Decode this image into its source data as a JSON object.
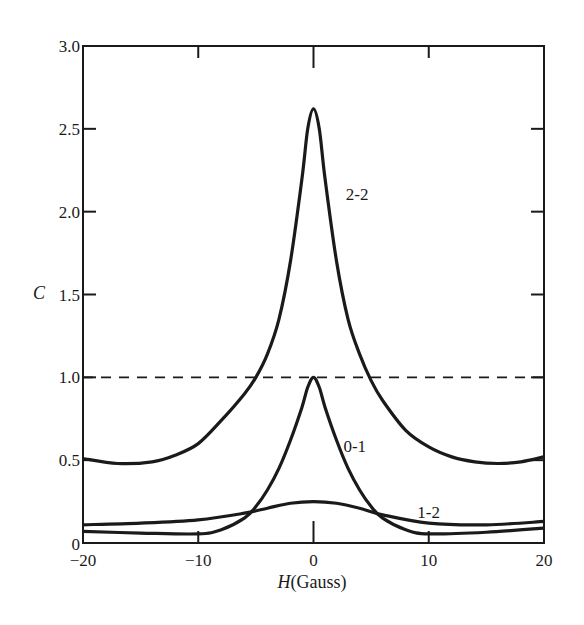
{
  "chart_data": {
    "type": "line",
    "title": "",
    "xlabel": "H(Gauss)",
    "xlabel_italic_part": "H",
    "xlabel_rest": "(Gauss)",
    "ylabel": "C",
    "xlim": [
      -20,
      20
    ],
    "ylim": [
      0,
      3.0
    ],
    "xticks": [
      -20,
      -10,
      0,
      10,
      20
    ],
    "xtick_labels": [
      "−20",
      "−10",
      "0",
      "10",
      "20"
    ],
    "yticks": [
      0,
      0.5,
      1.0,
      1.5,
      2.0,
      2.5,
      3.0
    ],
    "ytick_labels": [
      "0",
      "0.5",
      "1.0",
      "1.5",
      "2.0",
      "2.5",
      "3.0"
    ],
    "grid": false,
    "legend": "none (curves labeled inline)",
    "reference_line": {
      "y": 1.0,
      "style": "dashed"
    },
    "series": [
      {
        "name": "2-2",
        "label_pos": {
          "x": 2.8,
          "y": 2.07
        },
        "x": [
          -20,
          -17,
          -14,
          -12,
          -10,
          -8,
          -6,
          -5,
          -4,
          -3,
          -2,
          -1,
          -0.5,
          0,
          0.5,
          1,
          2,
          3,
          4,
          5,
          6,
          8,
          10,
          12,
          14,
          16,
          18,
          20
        ],
        "y": [
          0.51,
          0.48,
          0.49,
          0.53,
          0.6,
          0.74,
          0.9,
          1.0,
          1.14,
          1.35,
          1.7,
          2.2,
          2.5,
          2.62,
          2.5,
          2.2,
          1.7,
          1.35,
          1.14,
          0.98,
          0.86,
          0.68,
          0.58,
          0.52,
          0.49,
          0.48,
          0.49,
          0.52
        ]
      },
      {
        "name": "0-1",
        "label_pos": {
          "x": 2.6,
          "y": 0.55
        },
        "x": [
          -20,
          -15,
          -10,
          -8,
          -6,
          -5,
          -4,
          -3,
          -2,
          -1,
          -0.5,
          0,
          0.5,
          1,
          2,
          3,
          4,
          5,
          6,
          8,
          10,
          15,
          20
        ],
        "y": [
          0.07,
          0.06,
          0.055,
          0.08,
          0.15,
          0.22,
          0.32,
          0.45,
          0.62,
          0.82,
          0.94,
          1.0,
          0.94,
          0.82,
          0.62,
          0.45,
          0.32,
          0.22,
          0.15,
          0.08,
          0.055,
          0.065,
          0.09
        ]
      },
      {
        "name": "1-2",
        "label_pos": {
          "x": 9.0,
          "y": 0.15
        },
        "x": [
          -20,
          -15,
          -10,
          -6,
          -4,
          -2,
          0,
          2,
          4,
          6,
          10,
          15,
          20
        ],
        "y": [
          0.11,
          0.12,
          0.14,
          0.18,
          0.21,
          0.24,
          0.25,
          0.24,
          0.21,
          0.17,
          0.12,
          0.11,
          0.13
        ]
      }
    ]
  },
  "labels": {
    "y_axis": "C",
    "x_axis_italic": "H",
    "x_axis_rest": "(Gauss)"
  }
}
